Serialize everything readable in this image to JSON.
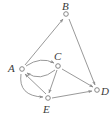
{
  "figure": {
    "type": "directed-graph",
    "width": 112,
    "height": 119,
    "background": "#ffffff",
    "edge_color": "#8d8d8d",
    "node_stroke": "#7b7b7b",
    "node_fill": "#ffffff",
    "label_color": "#3a3a3a"
  },
  "nodes": [
    {
      "id": "A",
      "label": "A",
      "x": 22,
      "y": 69,
      "label_x": 8,
      "label_y": 63
    },
    {
      "id": "B",
      "label": "B",
      "x": 66,
      "y": 14,
      "label_x": 62,
      "label_y": 1
    },
    {
      "id": "C",
      "label": "C",
      "x": 58,
      "y": 66,
      "label_x": 54,
      "label_y": 51
    },
    {
      "id": "D",
      "label": "D",
      "x": 97,
      "y": 90,
      "label_x": 101,
      "label_y": 86
    },
    {
      "id": "E",
      "label": "E",
      "x": 48,
      "y": 98,
      "label_x": 43,
      "label_y": 104
    }
  ],
  "edges": [
    {
      "from": "A",
      "to": "B",
      "shape": "straight",
      "arrow_at": "B"
    },
    {
      "from": "B",
      "to": "D",
      "shape": "straight",
      "arrow_at": "D"
    },
    {
      "from": "A",
      "to": "C",
      "shape": "curved-above",
      "arrow_at": "C"
    },
    {
      "from": "C",
      "to": "A",
      "shape": "curved-below",
      "arrow_at": "A"
    },
    {
      "from": "C",
      "to": "E",
      "shape": "straight",
      "arrow_at": "E"
    },
    {
      "from": "C",
      "to": "D",
      "shape": "straight",
      "arrow_at": "D"
    },
    {
      "from": "E",
      "to": "D",
      "shape": "straight",
      "arrow_at": "D"
    },
    {
      "from": "A",
      "to": "E",
      "shape": "curved-left",
      "arrow_at": "E"
    },
    {
      "from": "E",
      "to": "A",
      "shape": "straight",
      "arrow_at": "A"
    }
  ]
}
